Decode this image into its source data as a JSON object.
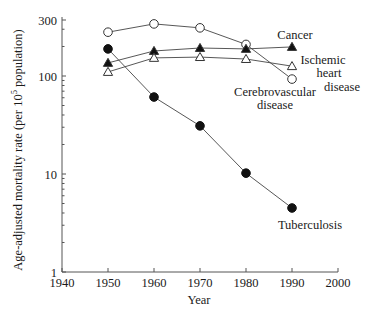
{
  "chart_data": {
    "type": "line",
    "title": "",
    "xlabel": "Year",
    "ylabel": "Age-adjusted mortality rate (per 10^5 population)",
    "ylabel_parts": {
      "before": "Age-adjusted mortality rate (per 10",
      "sup": "5",
      "after": " population)"
    },
    "yscale": "log",
    "xlim": [
      1940,
      2000
    ],
    "ylim": [
      1,
      300
    ],
    "x_ticks": [
      1940,
      1950,
      1960,
      1970,
      1980,
      1990,
      2000
    ],
    "y_ticks": [
      1,
      10,
      100,
      300
    ],
    "y_tick_labels": [
      "1",
      "10",
      "100",
      "300"
    ],
    "grid": false,
    "legend": "inline labels",
    "x": [
      1950,
      1960,
      1970,
      1980,
      1990
    ],
    "series": [
      {
        "name": "Cerebrovascular disease",
        "marker": "open-circle",
        "values": [
          280,
          340,
          310,
          210,
          93
        ],
        "label_lines": [
          "Cerebrovascular",
          "disease"
        ]
      },
      {
        "name": "Cancer",
        "marker": "filled-triangle",
        "values": [
          136,
          180,
          193,
          189,
          198
        ],
        "label_lines": [
          "Cancer"
        ]
      },
      {
        "name": "Ischemic heart disease",
        "marker": "open-triangle",
        "values": [
          110,
          153,
          156,
          149,
          126
        ],
        "label_lines": [
          "Ischemic",
          "heart",
          "disease"
        ]
      },
      {
        "name": "Tuberculosis",
        "marker": "filled-circle",
        "values": [
          189,
          61,
          31,
          10.2,
          4.5
        ],
        "label_lines": [
          "Tuberculosis"
        ]
      }
    ]
  }
}
